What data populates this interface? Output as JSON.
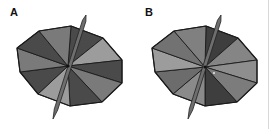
{
  "figure": {
    "panels": [
      {
        "label": "A",
        "center": [
          68,
          66
        ],
        "vertices": [
          [
            71,
            26
          ],
          [
            103,
            38
          ],
          [
            122,
            60
          ],
          [
            122,
            83
          ],
          [
            102,
            102
          ],
          [
            70,
            106
          ],
          [
            38,
            94
          ],
          [
            20,
            72
          ],
          [
            17,
            48
          ],
          [
            39,
            31
          ]
        ],
        "wedge_colors": [
          "#4a4a4a",
          "#9c9c9c",
          "#4a4a4a",
          "#7a7a7a",
          "#4a4a4a",
          "#9c9c9c",
          "#4a4a4a",
          "#7a7a7a",
          "#4a4a4a",
          "#7a7a7a"
        ],
        "needle": {
          "top": [
            86,
            15
          ],
          "bottom": [
            53,
            119
          ]
        },
        "dot": null
      },
      {
        "label": "B",
        "center": [
          205,
          67
        ],
        "vertices": [
          [
            206,
            26
          ],
          [
            238,
            38
          ],
          [
            257,
            60
          ],
          [
            257,
            83
          ],
          [
            237,
            102
          ],
          [
            205,
            106
          ],
          [
            173,
            94
          ],
          [
            155,
            72
          ],
          [
            152,
            48
          ],
          [
            174,
            31
          ]
        ],
        "wedge_colors": [
          "#3e3e3e",
          "#858585",
          "#8e8e8e",
          "#7c7c7c",
          "#3e3e3e",
          "#8a8a8a",
          "#6c6c6c",
          "#9c9c9c",
          "#727272",
          "#808080"
        ],
        "needle": {
          "top": [
            221,
            15
          ],
          "bottom": [
            188,
            119
          ]
        },
        "dot": [
          214,
          73
        ]
      }
    ],
    "colors": {
      "edge": "#1a1a1a",
      "needle_fill": "#6e6e6e",
      "needle_edge": "#222222",
      "background": "#ffffff",
      "rule": "#d8d8d8"
    }
  }
}
